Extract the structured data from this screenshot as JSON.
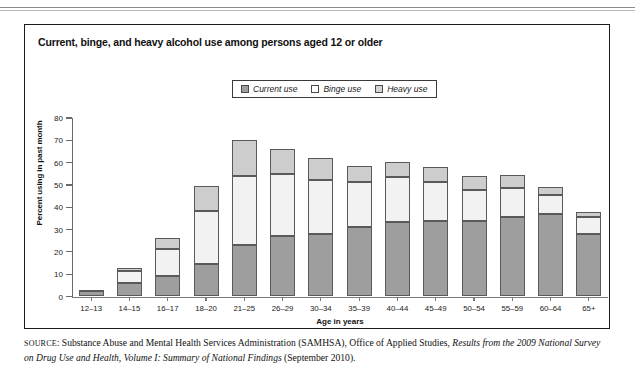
{
  "panel": {
    "title": "Current, binge, and heavy alcohol use among persons aged 12 or older"
  },
  "legend": {
    "items": [
      {
        "label": "Current use",
        "color": "#9e9e9e",
        "icon": "legend-swatch-icon"
      },
      {
        "label": "Binge use",
        "color": "#ffffff",
        "icon": "legend-swatch-icon"
      },
      {
        "label": "Heavy use",
        "color": "#d5d5d5",
        "icon": "legend-swatch-icon"
      }
    ]
  },
  "source": {
    "prefix": "SOURCE",
    "text_1": ": Substance Abuse and Mental Health Services Administration (SAMHSA), Office of Applied Studies, ",
    "italic_1": "Results from the 2009 National Survey on Drug Use and Health, Volume I: Summary of National Findings",
    "text_2": " (September 2010)."
  },
  "chart_data": {
    "type": "bar",
    "stacked": true,
    "title": "Current, binge, and heavy alcohol use among persons aged 12 or older",
    "xlabel": "Age in years",
    "ylabel": "Percent using in past month",
    "ylim": [
      0,
      80
    ],
    "yticks": [
      0,
      10,
      20,
      30,
      40,
      50,
      60,
      70,
      80
    ],
    "grid": false,
    "legend_position": "top-center",
    "categories": [
      "12–13",
      "14–15",
      "16–17",
      "18–20",
      "21–25",
      "26–29",
      "30–34",
      "35–39",
      "40–44",
      "45–49",
      "50–54",
      "55–59",
      "60–64",
      "65+"
    ],
    "series": [
      {
        "name": "Current use",
        "color": "#9e9e9e",
        "values": [
          2.5,
          6.0,
          9.2,
          14.5,
          23.2,
          27.2,
          27.8,
          31.3,
          33.4,
          33.8,
          33.7,
          35.6,
          36.8,
          28.0
        ]
      },
      {
        "name": "Binge use",
        "color": "#f2f2f2",
        "values": [
          0.4,
          5.5,
          12.3,
          23.6,
          31.0,
          27.8,
          24.4,
          20.0,
          20.0,
          17.5,
          13.9,
          13.1,
          8.7,
          7.6
        ]
      },
      {
        "name": "Heavy use",
        "color": "#cdcdcd",
        "values": [
          0.2,
          1.3,
          4.6,
          11.2,
          15.8,
          11.0,
          9.8,
          7.4,
          7.1,
          6.7,
          6.4,
          5.8,
          3.5,
          2.4
        ]
      }
    ],
    "totals": [
      3.1,
      12.8,
      26.1,
      49.3,
      70.0,
      66.0,
      62.0,
      58.7,
      60.5,
      58.0,
      54.0,
      54.5,
      49.0,
      38.0
    ]
  }
}
